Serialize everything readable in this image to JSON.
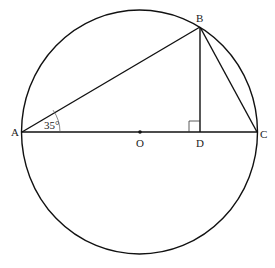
{
  "figure": {
    "type": "geometry",
    "colors": {
      "stroke": "#111111",
      "background": "#ffffff"
    },
    "circle": {
      "center": "O",
      "cx": 139.5,
      "cy": 132,
      "rx": 118,
      "ry": 122
    },
    "points": {
      "A": {
        "label": "A",
        "x": 22,
        "y": 132
      },
      "B": {
        "label": "B",
        "x": 200,
        "y": 27
      },
      "C": {
        "label": "C",
        "x": 257,
        "y": 132
      },
      "D": {
        "label": "D",
        "x": 200,
        "y": 132
      },
      "O": {
        "label": "O",
        "x": 140,
        "y": 132
      }
    },
    "segments": [
      "AB",
      "BC",
      "AC",
      "BD"
    ],
    "angle_label": "35°",
    "angle_vertex": "A",
    "right_angle_at": "D"
  }
}
